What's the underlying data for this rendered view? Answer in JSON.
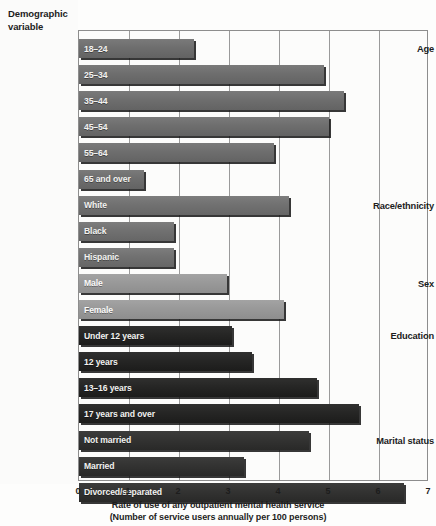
{
  "header": {
    "line1": "Demographic",
    "line2": "variable"
  },
  "groups": [
    {
      "name": "Age"
    },
    {
      "name": "Race/ethnicity"
    },
    {
      "name": "Sex"
    },
    {
      "name": "Education"
    },
    {
      "name": "Marital status"
    }
  ],
  "axis": {
    "ticks": [
      "0",
      "1",
      "2",
      "3",
      "4",
      "5",
      "6",
      "7"
    ],
    "title_line1": "Rate of use of any outpatient mental health service",
    "title_line2": "(Number of service users annually per 100 persons)"
  },
  "colors": {
    "age_bar": "#6e6e6e",
    "race_bar": "#717171",
    "sex_bar": "#999999",
    "education_bar": "#262625",
    "marital_bar": "#333332",
    "gridline": "#9a9a9a",
    "plot_border": "#8d8d8d",
    "background": "#fdfdfc",
    "label_text": "#1d1d1d",
    "bar_text": "#f2f2f0"
  },
  "chart_data": {
    "type": "bar",
    "orientation": "horizontal",
    "title": "",
    "xlabel": "Rate of use of any outpatient mental health service (Number of service users annually per 100 persons)",
    "ylabel": "Demographic variable",
    "xlim": [
      0,
      7
    ],
    "xticks": [
      0,
      1,
      2,
      3,
      4,
      5,
      6,
      7
    ],
    "grid": "vertical",
    "legend": "none",
    "groups": [
      {
        "group": "Age",
        "tone": "t-age",
        "categories": [
          "18–24",
          "25–34",
          "35–44",
          "45–54",
          "55–64",
          "65 and over"
        ],
        "values": [
          2.3,
          4.9,
          5.3,
          5.0,
          3.9,
          1.3
        ]
      },
      {
        "group": "Race/ethnicity",
        "tone": "t-race",
        "categories": [
          "White",
          "Black",
          "Hispanic"
        ],
        "values": [
          4.2,
          1.9,
          1.9
        ]
      },
      {
        "group": "Sex",
        "tone": "t-sex",
        "categories": [
          "Male",
          "Female"
        ],
        "values": [
          2.95,
          4.1
        ]
      },
      {
        "group": "Education",
        "tone": "t-edu",
        "categories": [
          "Under 12 years",
          "12 years",
          "13–16 years",
          "17 years and over"
        ],
        "values": [
          3.05,
          3.45,
          4.75,
          5.6
        ]
      },
      {
        "group": "Marital status",
        "tone": "t-mar",
        "categories": [
          "Not married",
          "Married",
          "Divorced/separated"
        ],
        "values": [
          4.6,
          3.3,
          6.5
        ]
      }
    ]
  }
}
